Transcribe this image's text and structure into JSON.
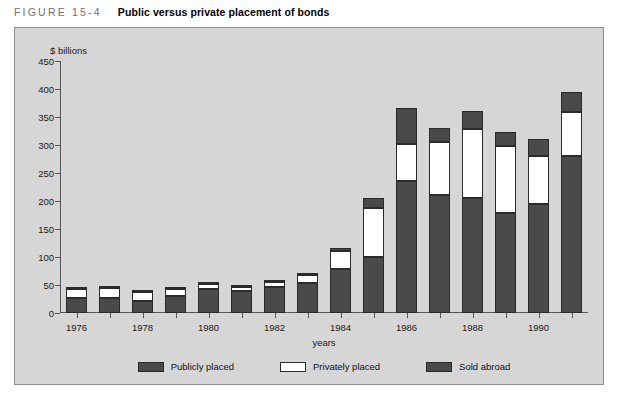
{
  "caption": {
    "figure_label": "FIGURE 15-4",
    "title": "Public versus private placement of bonds"
  },
  "chart_data": {
    "type": "bar",
    "stacked": true,
    "title": "Public versus private placement of bonds",
    "xlabel": "years",
    "ylabel": "$ billions",
    "ylim": [
      0,
      450
    ],
    "yticks": [
      0,
      50,
      100,
      150,
      200,
      250,
      300,
      350,
      400,
      450
    ],
    "grid": false,
    "legend_position": "bottom-center",
    "categories": [
      "1976",
      "1977",
      "1978",
      "1979",
      "1980",
      "1981",
      "1982",
      "1983",
      "1984",
      "1985",
      "1986",
      "1987",
      "1988",
      "1989",
      "1990",
      "1991"
    ],
    "xtick_labels": [
      "1976",
      "1978",
      "1980",
      "1982",
      "1984",
      "1986",
      "1988",
      "1990"
    ],
    "series": [
      {
        "name": "Publicly placed",
        "color": "#4a4a4a",
        "values": [
          27,
          27,
          22,
          31,
          42,
          40,
          47,
          53,
          78,
          100,
          236,
          211,
          205,
          178,
          194,
          281
        ]
      },
      {
        "name": "Privately placed",
        "color": "#ffffff",
        "values": [
          16,
          17,
          15,
          12,
          9,
          6,
          8,
          15,
          33,
          88,
          65,
          95,
          123,
          121,
          86,
          78
        ]
      },
      {
        "name": "Sold abroad",
        "color": "#4a4a4a",
        "values": [
          2,
          2,
          2,
          2,
          3,
          2,
          2,
          3,
          5,
          18,
          65,
          25,
          32,
          25,
          30,
          35
        ]
      }
    ],
    "totals": [
      45,
      46,
      39,
      45,
      54,
      48,
      57,
      71,
      116,
      206,
      366,
      331,
      360,
      324,
      310,
      394
    ]
  },
  "legend": {
    "items": [
      {
        "label": "Publicly placed"
      },
      {
        "label": "Privately placed"
      },
      {
        "label": "Sold abroad"
      }
    ]
  },
  "colors": {
    "panel_background": "#d6d6d6",
    "bar_dark": "#4a4a4a",
    "bar_white": "#ffffff",
    "axis": "#555555"
  }
}
